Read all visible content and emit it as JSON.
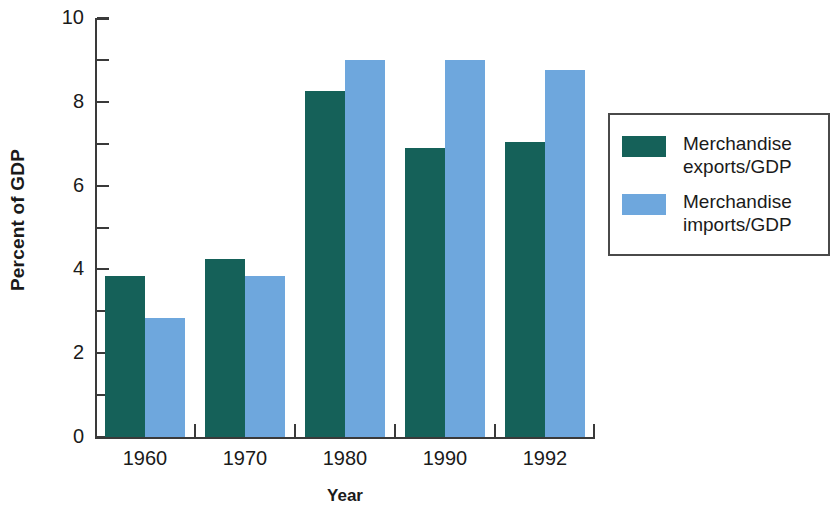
{
  "chart_data": {
    "type": "bar",
    "title": "",
    "xlabel": "Year",
    "ylabel": "Percent of GDP",
    "categories": [
      "1960",
      "1970",
      "1980",
      "1990",
      "1992"
    ],
    "series": [
      {
        "name": "Merchandise\nexports/GDP",
        "color": "#156159",
        "values": [
          3.85,
          4.25,
          8.25,
          6.9,
          7.05
        ]
      },
      {
        "name": "Merchandise\nimports/GDP",
        "color": "#6ea7dd",
        "values": [
          2.85,
          3.85,
          9.0,
          9.0,
          8.75
        ]
      }
    ],
    "ylim": [
      0,
      10
    ],
    "y_major_ticks": [
      0,
      2,
      4,
      6,
      8,
      10
    ],
    "y_minor_ticks": [
      1,
      3,
      5,
      7,
      9
    ],
    "y_tick_labels": [
      "0",
      "2",
      "4",
      "6",
      "8",
      "10"
    ],
    "grid": false,
    "legend_position": "right"
  },
  "legend": {
    "entries": [
      {
        "label": "Merchandise\nexports/GDP",
        "color": "#156159"
      },
      {
        "label": "Merchandise\nimports/GDP",
        "color": "#6ea7dd"
      }
    ]
  },
  "axes": {
    "y_title": "Percent of GDP",
    "x_title": "Year"
  }
}
